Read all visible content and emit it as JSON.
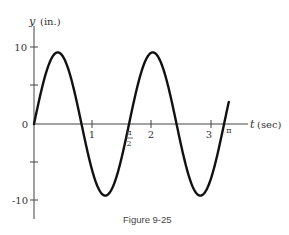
{
  "chart_data": {
    "type": "line",
    "title": "",
    "caption": "Figure 9-25",
    "xlabel": "t (sec)",
    "ylabel": "y (in.)",
    "x_ticks": [
      {
        "value": 1,
        "label": "1"
      },
      {
        "value": 1.5708,
        "label": "π/2"
      },
      {
        "value": 2,
        "label": "2"
      },
      {
        "value": 3,
        "label": "3"
      },
      {
        "value": 3.1416,
        "label": "π"
      }
    ],
    "y_ticks": [
      {
        "value": 10,
        "label": "10"
      },
      {
        "value": 5,
        "label": ""
      },
      {
        "value": 0,
        "label": "0"
      },
      {
        "value": -5,
        "label": ""
      },
      {
        "value": -10,
        "label": "-10"
      }
    ],
    "xlim": [
      0,
      3.2
    ],
    "ylim": [
      -11.5,
      12
    ],
    "grid": false,
    "legend": null,
    "series": [
      {
        "name": "y(t)",
        "function": "9.3*sin(4t)",
        "amplitude": 9.3,
        "angular_frequency": 4,
        "period": 1.5708,
        "x": [
          0,
          0.3927,
          0.7854,
          1.1781,
          1.5708,
          1.9635,
          2.3562,
          2.7489,
          3.1416,
          3.22
        ],
        "values": [
          0,
          9.3,
          0,
          -9.3,
          0,
          9.3,
          0,
          -9.3,
          0,
          2.9
        ]
      }
    ]
  },
  "labels": {
    "y_axis": "y",
    "y_unit": "(in.)",
    "x_axis": "t",
    "x_unit": "(sec)",
    "y_tick_10": "10",
    "y_tick_0": "0",
    "y_tick_neg10": "-10",
    "x_tick_1": "1",
    "x_tick_2": "2",
    "x_tick_3": "3",
    "pi_over_2_num": "π",
    "pi_over_2_den": "2",
    "pi": "π",
    "caption": "Figure 9-25"
  }
}
